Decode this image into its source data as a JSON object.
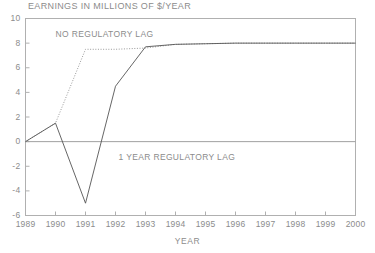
{
  "chart_data": {
    "type": "line",
    "title": "EARNINGS IN MILLIONS OF $/YEAR",
    "xlabel": "YEAR",
    "ylabel": "",
    "xlim": [
      1989,
      2000
    ],
    "ylim": [
      -6,
      10
    ],
    "grid": false,
    "legend_position": "inline-annotations",
    "x": [
      1989,
      1990,
      1991,
      1992,
      1993,
      1994,
      1995,
      1996,
      1997,
      1998,
      1999,
      2000
    ],
    "xticks": [
      "1989",
      "1990",
      "1991",
      "1992",
      "1993",
      "1994",
      "1995",
      "1996",
      "1997",
      "1998",
      "1999",
      "2000"
    ],
    "yticks": [
      "-6",
      "-4",
      "-2",
      "0",
      "2",
      "4",
      "6",
      "8",
      "10"
    ],
    "ytick_values": [
      -6,
      -4,
      -2,
      0,
      2,
      4,
      6,
      8,
      10
    ],
    "zero_line": 0,
    "series": [
      {
        "name": "NO REGULATORY LAG",
        "style": "dotted",
        "color": "#999999",
        "values": [
          0,
          1.5,
          7.5,
          7.5,
          7.6,
          7.9,
          7.95,
          8.0,
          8.0,
          8.0,
          8.0,
          8.0
        ]
      },
      {
        "name": "1 YEAR REGULATORY LAG",
        "style": "solid",
        "color": "#555555",
        "values": [
          0,
          1.5,
          -5.0,
          4.5,
          7.7,
          7.9,
          7.95,
          8.0,
          8.0,
          8.0,
          8.0,
          8.0
        ]
      }
    ],
    "annotations": [
      {
        "text": "NO REGULATORY LAG",
        "x": 1990.0,
        "y": 8.7
      },
      {
        "text": "1 YEAR REGULATORY LAG",
        "x": 1992.1,
        "y": -1.3
      }
    ]
  },
  "axis_colors": {
    "frame": "#b0b0b0",
    "text": "#8c8c8c",
    "zero_line": "#a0a0a0"
  }
}
